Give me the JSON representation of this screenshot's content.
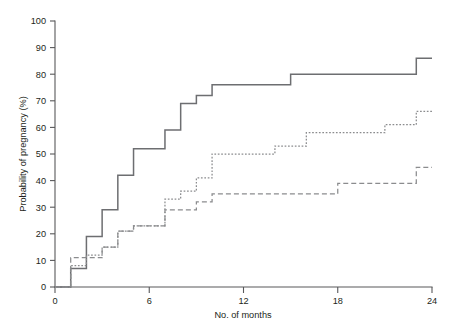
{
  "chart_data": {
    "type": "line",
    "title": "",
    "subtitle": "",
    "xlabel": "No. of months",
    "ylabel": "Probability of pregnancy (%)",
    "xlim": [
      0,
      24
    ],
    "ylim": [
      0,
      100
    ],
    "xticks": [
      0,
      6,
      12,
      18,
      24
    ],
    "xtick_labels": [
      "0",
      "6",
      "12",
      "18",
      "24"
    ],
    "yticks": [
      0,
      10,
      20,
      30,
      40,
      50,
      60,
      70,
      80,
      90,
      100
    ],
    "ytick_labels": [
      "0",
      "10",
      "20",
      "30",
      "40",
      "50",
      "60",
      "70",
      "80",
      "90",
      "100"
    ],
    "grid": false,
    "legend": "none",
    "step_mode": "post",
    "series": [
      {
        "name": "solid-curve",
        "style": "solid",
        "color": "#6d6e71",
        "x": [
          0,
          1,
          1,
          2,
          2,
          3,
          3,
          4,
          4,
          5,
          5,
          6,
          6,
          7,
          7,
          8,
          8,
          9,
          9,
          10,
          10,
          11,
          11,
          15,
          15,
          23,
          23,
          24
        ],
        "y": [
          0,
          0,
          7,
          7,
          19,
          19,
          29,
          29,
          42,
          42,
          52,
          52,
          52,
          52,
          59,
          59,
          69,
          69,
          72,
          72,
          76,
          76,
          76,
          76,
          80,
          80,
          86,
          86
        ],
        "points": [
          {
            "month": 0,
            "value": 0
          },
          {
            "month": 1,
            "value": 7
          },
          {
            "month": 2,
            "value": 19
          },
          {
            "month": 3,
            "value": 29
          },
          {
            "month": 4,
            "value": 42
          },
          {
            "month": 5,
            "value": 52
          },
          {
            "month": 7,
            "value": 59
          },
          {
            "month": 8,
            "value": 69
          },
          {
            "month": 9,
            "value": 72
          },
          {
            "month": 10,
            "value": 76
          },
          {
            "month": 15,
            "value": 80
          },
          {
            "month": 23,
            "value": 86
          },
          {
            "month": 24,
            "value": 86
          }
        ]
      },
      {
        "name": "dotted-curve",
        "style": "dotted",
        "color": "#8b8c8e",
        "points": [
          {
            "month": 0,
            "value": 0
          },
          {
            "month": 1,
            "value": 8
          },
          {
            "month": 2,
            "value": 12
          },
          {
            "month": 3,
            "value": 15
          },
          {
            "month": 4,
            "value": 21
          },
          {
            "month": 5,
            "value": 23
          },
          {
            "month": 7,
            "value": 33
          },
          {
            "month": 8,
            "value": 36
          },
          {
            "month": 9,
            "value": 41
          },
          {
            "month": 10,
            "value": 50
          },
          {
            "month": 14,
            "value": 53
          },
          {
            "month": 16,
            "value": 58
          },
          {
            "month": 21,
            "value": 61
          },
          {
            "month": 23,
            "value": 66
          },
          {
            "month": 24,
            "value": 66
          }
        ]
      },
      {
        "name": "dashed-curve",
        "style": "dashed",
        "color": "#8b8c8e",
        "points": [
          {
            "month": 0,
            "value": 0
          },
          {
            "month": 1,
            "value": 11
          },
          {
            "month": 3,
            "value": 15
          },
          {
            "month": 4,
            "value": 21
          },
          {
            "month": 5,
            "value": 23
          },
          {
            "month": 7,
            "value": 29
          },
          {
            "month": 9,
            "value": 32
          },
          {
            "month": 10,
            "value": 35
          },
          {
            "month": 18,
            "value": 39
          },
          {
            "month": 23,
            "value": 45
          },
          {
            "month": 24,
            "value": 45
          }
        ]
      }
    ]
  }
}
